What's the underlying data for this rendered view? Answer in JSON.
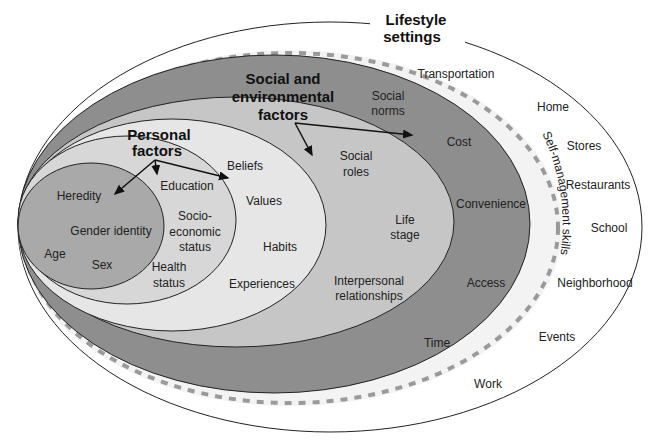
{
  "diagram": {
    "title": {
      "line1": "Lifestyle",
      "line2": "settings"
    },
    "colors": {
      "outer": "#ffffff",
      "dashed_ring_band": "#f4f4f4",
      "dark_ring": "#8e8e8e",
      "medium_ring": "#c4c4c4",
      "personal_outer": "#e6e6e6",
      "personal_mid": "#d6d6d6",
      "inner": "#a8a8a8",
      "dash": "#999999",
      "stroke": "#222222"
    },
    "lifestyle_settings": [
      "Transportation",
      "Home",
      "Stores",
      "Restaurants",
      "School",
      "Neighborhood",
      "Events",
      "Work"
    ],
    "self_management": "Self-management skills",
    "social_environmental": {
      "heading": {
        "line1": "Social and",
        "line2": "environmental",
        "line3": "factors"
      },
      "outer_ring": [
        "Social norms",
        "Cost",
        "Convenience",
        "Access",
        "Time"
      ],
      "social_norms": {
        "line1": "Social",
        "line2": "norms"
      },
      "inner_ring": {
        "social_roles": {
          "line1": "Social",
          "line2": "roles"
        },
        "life_stage": {
          "line1": "Life",
          "line2": "stage"
        },
        "interpersonal": {
          "line1": "Interpersonal",
          "line2": "relationships"
        }
      }
    },
    "personal": {
      "heading": {
        "line1": "Personal",
        "line2": "factors"
      },
      "outer_ring": [
        "Beliefs",
        "Values",
        "Habits",
        "Experiences"
      ],
      "mid_ring": {
        "education": "Education",
        "socioeconomic": {
          "line1": "Socio-",
          "line2": "economic",
          "line3": "status"
        },
        "health": {
          "line1": "Health",
          "line2": "status"
        }
      },
      "inner": [
        "Heredity",
        "Gender identity",
        "Age",
        "Sex"
      ]
    }
  }
}
